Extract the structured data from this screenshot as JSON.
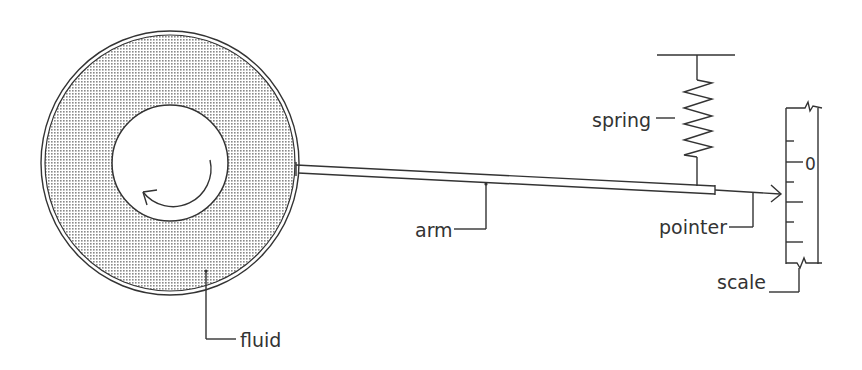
{
  "diagram": {
    "type": "viscometer schematic (rotating cylinder in fluid, arm, spring, pointer, scale)",
    "labels": {
      "spring": "spring",
      "arm": "arm",
      "pointer": "pointer",
      "scale": "scale",
      "fluid": "fluid"
    },
    "scale": {
      "zero_mark": "0",
      "tick_count": 7
    },
    "colors": {
      "ink": "#333333",
      "fluid_fill": "#b0b0b0",
      "background": "#ffffff"
    },
    "icons": {
      "rotation": "counterclockwise-arrow-icon",
      "pointer_head": "arrow-right-icon"
    }
  }
}
